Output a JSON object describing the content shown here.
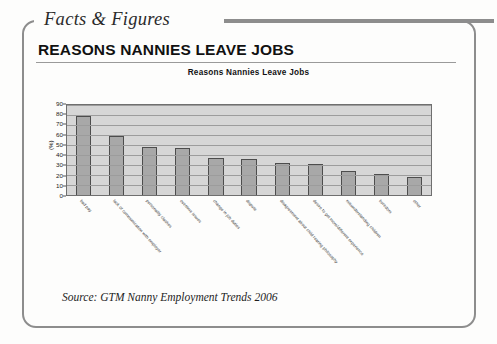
{
  "eyebrow": {
    "label": "Facts & Figures"
  },
  "headline": {
    "text": "REASONS NANNIES LEAVE JOBS"
  },
  "source": {
    "text": "Source: GTM Nanny Employment Trends 2006"
  },
  "colors": {
    "frame": "#8d8d8d",
    "plot_background": "#d6d6d6",
    "gridline": "#9c9c9c",
    "bar_fill": "#a8a8a8",
    "bar_border": "#4d4d4d",
    "text": "#1b1b1b"
  },
  "chart_data": {
    "type": "bar",
    "title": "Reasons Nannies Leave Jobs",
    "xlabel": "",
    "ylabel": "(%)",
    "ylim": [
      0,
      90
    ],
    "ytick_step": 10,
    "yticks": [
      0,
      10,
      20,
      30,
      40,
      50,
      60,
      70,
      80,
      90
    ],
    "grid": true,
    "legend": false,
    "categories": [
      "bad pay",
      "lack of communication with employer",
      "personality clashes",
      "overtime issues",
      "change in job duties",
      "dispute",
      "disagreement about child rearing philosophy",
      "desire to get more/different experience",
      "misunderstanding children",
      "boredom",
      "other"
    ],
    "values": [
      79,
      59,
      48,
      47,
      37,
      36,
      32,
      31,
      24,
      21,
      18
    ]
  }
}
